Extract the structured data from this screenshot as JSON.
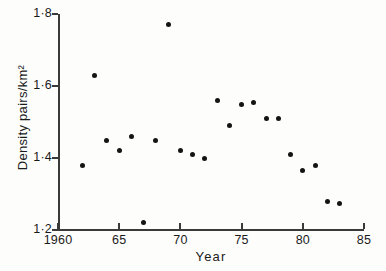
{
  "chart_data": {
    "type": "scatter",
    "title": "",
    "xlabel": "Year",
    "ylabel": "Density pairs/km²",
    "xlim": [
      1960,
      1985
    ],
    "ylim": [
      1.2,
      1.8
    ],
    "grid": false,
    "legend": "none",
    "x_tick_labels": [
      "1960",
      "65",
      "70",
      "75",
      "80",
      "85"
    ],
    "x_tick_values": [
      1960,
      1965,
      1970,
      1975,
      1980,
      1985
    ],
    "y_tick_labels": [
      "1·2",
      "1·4",
      "1·6",
      "1·8"
    ],
    "y_tick_values": [
      1.2,
      1.4,
      1.6,
      1.8
    ],
    "marker": "filled-circle",
    "marker_color": "#141414",
    "points": [
      {
        "x": 1962,
        "y": 1.38
      },
      {
        "x": 1963,
        "y": 1.63
      },
      {
        "x": 1964,
        "y": 1.45
      },
      {
        "x": 1965,
        "y": 1.42
      },
      {
        "x": 1966,
        "y": 1.46
      },
      {
        "x": 1967,
        "y": 1.22
      },
      {
        "x": 1968,
        "y": 1.45
      },
      {
        "x": 1969,
        "y": 1.77
      },
      {
        "x": 1970,
        "y": 1.42
      },
      {
        "x": 1971,
        "y": 1.41
      },
      {
        "x": 1972,
        "y": 1.4
      },
      {
        "x": 1973,
        "y": 1.56
      },
      {
        "x": 1974,
        "y": 1.49
      },
      {
        "x": 1975,
        "y": 1.55
      },
      {
        "x": 1976,
        "y": 1.555
      },
      {
        "x": 1977,
        "y": 1.51
      },
      {
        "x": 1978,
        "y": 1.51
      },
      {
        "x": 1979,
        "y": 1.41
      },
      {
        "x": 1980,
        "y": 1.365
      },
      {
        "x": 1981,
        "y": 1.38
      },
      {
        "x": 1982,
        "y": 1.28
      },
      {
        "x": 1983,
        "y": 1.275
      }
    ],
    "axis_color": "#3a3a3a",
    "background_color": "#fdfdfc"
  },
  "geometry": {
    "plot_left": 58,
    "plot_right": 364,
    "plot_top": 14,
    "plot_bottom": 230
  }
}
